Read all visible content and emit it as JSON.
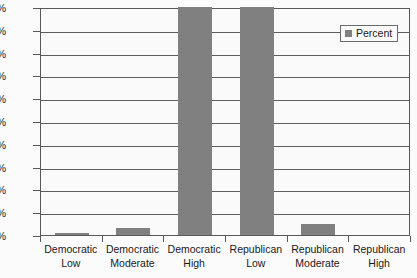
{
  "chart_data": {
    "type": "bar",
    "title": "",
    "xlabel": "",
    "ylabel": "",
    "ylim": [
      0,
      100
    ],
    "grid": true,
    "legend_position": "top-right",
    "categories": [
      "Democratic Low",
      "Democratic Moderate",
      "Democratic High",
      "Republican Low",
      "Republican Moderate",
      "Republican High"
    ],
    "category_lines": [
      [
        "Democratic",
        "Low"
      ],
      [
        "Democratic",
        "Moderate"
      ],
      [
        "Democratic",
        "High"
      ],
      [
        "Republican",
        "Low"
      ],
      [
        "Republican",
        "Moderate"
      ],
      [
        "Republican",
        "High"
      ]
    ],
    "series": [
      {
        "name": "Percent",
        "color": "#808080",
        "values": [
          1,
          3,
          100,
          100,
          5,
          0
        ]
      }
    ],
    "ytick_labels": [
      "100%",
      "90%",
      "80%",
      "70%",
      "60%",
      "50%",
      "40%",
      "30%",
      "20%",
      "10%",
      "0%"
    ],
    "ytick_values": [
      100,
      90,
      80,
      70,
      60,
      50,
      40,
      30,
      20,
      10,
      0
    ]
  },
  "legend": {
    "entries": [
      {
        "label": "Percent",
        "color": "#808080"
      }
    ]
  },
  "colors": {
    "bar": "#808080",
    "axis": "#59595b",
    "gridline": "#5d5d5f",
    "text": "#19191b",
    "plot_background": "#fafafa",
    "page_background": "#fbfbfb"
  }
}
